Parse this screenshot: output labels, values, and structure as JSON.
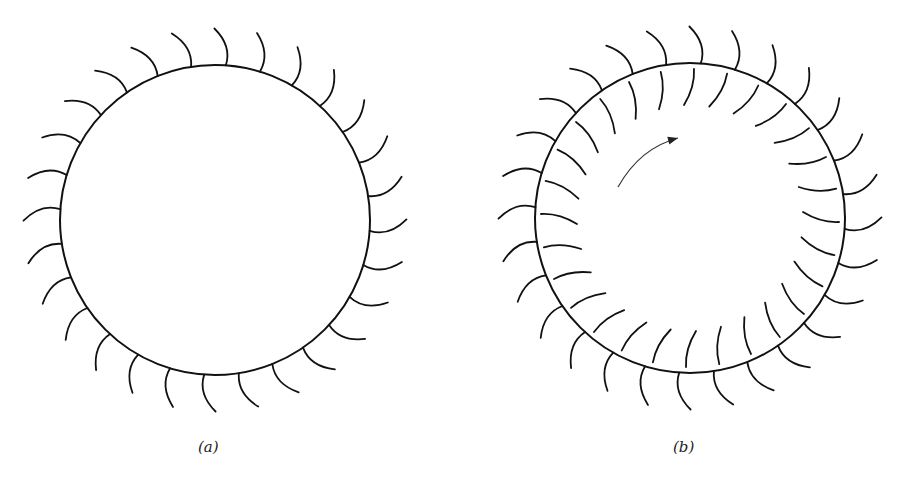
{
  "figure": {
    "stroke_color": "#111111",
    "background": "#ffffff",
    "panels": [
      {
        "id": "a",
        "label": "(a)",
        "cx": 215,
        "cy": 220,
        "r": 155,
        "outer_hooks": {
          "count": 28,
          "offset_deg": 4,
          "length": 36,
          "curl": 14
        },
        "inner_hooks": null,
        "arrow": null
      },
      {
        "id": "b",
        "label": "(b)",
        "cx": 690,
        "cy": 218,
        "r": 155,
        "outer_hooks": {
          "count": 28,
          "offset_deg": 4,
          "length": 36,
          "curl": 14
        },
        "inner_hooks": {
          "count": 28,
          "offset_deg": 0,
          "inset": 6,
          "length": 36,
          "curl": 10
        },
        "arrow": {
          "from": [
            618,
            187
          ],
          "ctrl": [
            640,
            148
          ],
          "to": [
            678,
            138
          ]
        }
      }
    ]
  }
}
